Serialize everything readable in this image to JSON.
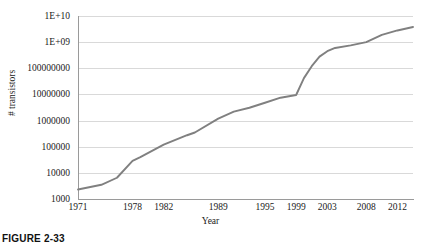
{
  "caption": "FIGURE 2-33",
  "chart_data": {
    "type": "line",
    "title": "",
    "xlabel": "Year",
    "ylabel": "# transistors",
    "yscale": "log",
    "ylim": [
      1000,
      10000000000
    ],
    "xlim": [
      1971,
      2014
    ],
    "grid": true,
    "legend": false,
    "legend_position": "none",
    "line_color": "#808080",
    "gridline_color": "#d9d9d9",
    "axis_color": "#9a9a9a",
    "background_color": "#ffffff",
    "ytick_labels": [
      "1E+10",
      "1E+09",
      "100000000",
      "10000000",
      "1000000",
      "100000",
      "10000",
      "1000"
    ],
    "ytick_values": [
      10000000000,
      1000000000,
      100000000,
      10000000,
      1000000,
      100000,
      10000,
      1000
    ],
    "xtick_labels": [
      "1971",
      "1978",
      "1982",
      "1989",
      "1995",
      "1999",
      "2003",
      "2008",
      "2012"
    ],
    "xtick_values": [
      1971,
      1978,
      1982,
      1989,
      1995,
      1999,
      2003,
      2008,
      2012
    ],
    "series": [
      {
        "name": "# transistors",
        "x": [
          1971,
          1974,
          1976,
          1978,
          1979,
          1982,
          1985,
          1986,
          1989,
          1991,
          1993,
          1995,
          1997,
          1999,
          2000,
          2001,
          2002,
          2003,
          2004,
          2006,
          2008,
          2010,
          2012,
          2014
        ],
        "values": [
          2300,
          3500,
          6500,
          29000,
          40000,
          120000,
          275000,
          350000,
          1180000,
          2200000,
          3100000,
          4800000,
          7500000,
          9500000,
          42000000,
          120000000,
          280000000,
          450000000,
          600000000,
          750000000,
          1000000000,
          1900000000,
          2800000000,
          3800000000
        ]
      }
    ]
  }
}
